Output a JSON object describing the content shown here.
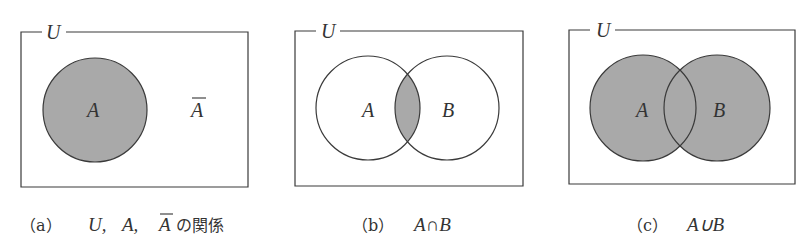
{
  "colors": {
    "stroke": "#3a3a3a",
    "shade": "#a9a9a9",
    "background": "#ffffff",
    "text": "#333333"
  },
  "panels": [
    {
      "id": "a",
      "universe_label": "U",
      "sets": [
        {
          "name": "A",
          "shaded": true
        }
      ],
      "complement_label": "A",
      "complement_overline": true,
      "caption": {
        "prefix": "（a）",
        "math_parts": [
          "U,",
          "A,",
          "A"
        ],
        "overlined_part_index": 2,
        "suffix": "の関係"
      }
    },
    {
      "id": "b",
      "universe_label": "U",
      "sets": [
        {
          "name": "A",
          "shaded": false
        },
        {
          "name": "B",
          "shaded": false
        }
      ],
      "shaded_region": "intersection",
      "caption": {
        "prefix": "（b）",
        "expression": "A∩B"
      }
    },
    {
      "id": "c",
      "universe_label": "U",
      "sets": [
        {
          "name": "A",
          "shaded": true
        },
        {
          "name": "B",
          "shaded": true
        }
      ],
      "shaded_region": "union",
      "caption": {
        "prefix": "（c）",
        "expression": "A∪B"
      }
    }
  ]
}
